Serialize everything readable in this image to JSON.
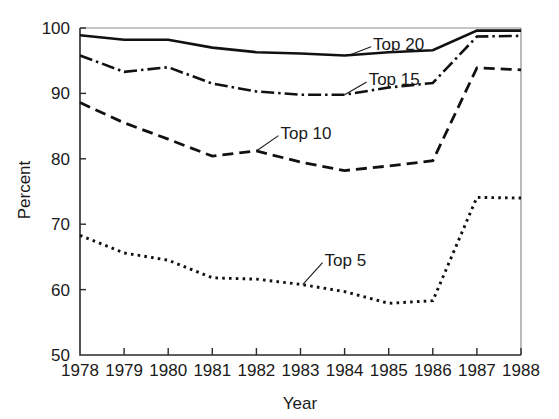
{
  "chart_data": {
    "type": "line",
    "title": "",
    "xlabel": "Year",
    "ylabel": "Percent",
    "x": [
      1978,
      1979,
      1980,
      1981,
      1982,
      1983,
      1984,
      1985,
      1986,
      1987,
      1988
    ],
    "categories": [
      "1978",
      "1979",
      "1980",
      "1981",
      "1982",
      "1983",
      "1984",
      "1985",
      "1986",
      "1987",
      "1988"
    ],
    "xlim": [
      1978,
      1988
    ],
    "ylim": [
      50,
      100
    ],
    "y_ticks": [
      50,
      60,
      70,
      80,
      90,
      100
    ],
    "y_tick_labels": [
      "50",
      "60",
      "70",
      "80",
      "90",
      "100"
    ],
    "x_ticks": [
      1978,
      1979,
      1980,
      1981,
      1982,
      1983,
      1984,
      1985,
      1986,
      1987,
      1988
    ],
    "grid": false,
    "legend_position": "inline-annotations",
    "series": [
      {
        "name": "Top 20",
        "style": "solid",
        "color": "#111111",
        "values": [
          98.9,
          98.2,
          98.2,
          97.0,
          96.3,
          96.1,
          95.8,
          96.3,
          96.6,
          99.6,
          99.6
        ]
      },
      {
        "name": "Top 15",
        "style": "dash-dot",
        "color": "#111111",
        "values": [
          95.8,
          93.3,
          94.0,
          91.5,
          90.3,
          89.8,
          89.8,
          90.9,
          91.6,
          98.7,
          98.8
        ]
      },
      {
        "name": "Top 10",
        "style": "dashed",
        "color": "#111111",
        "values": [
          88.6,
          85.5,
          83.0,
          80.4,
          81.2,
          79.5,
          78.2,
          78.9,
          79.7,
          93.9,
          93.6
        ]
      },
      {
        "name": "Top 5",
        "style": "dotted",
        "color": "#111111",
        "values": [
          68.3,
          65.6,
          64.5,
          61.8,
          61.6,
          60.8,
          59.7,
          57.9,
          58.3,
          74.1,
          74.0
        ]
      }
    ],
    "annotations": [
      {
        "text": "Top 20",
        "series": "Top 20",
        "at_x": 1984.1,
        "label_x": 1984.6,
        "label_y": 97.6
      },
      {
        "text": "Top 15",
        "series": "Top 15",
        "at_x": 1984.0,
        "label_x": 1984.5,
        "label_y": 92.2
      },
      {
        "text": "Top 10",
        "series": "Top 10",
        "at_x": 1982.0,
        "label_x": 1982.5,
        "label_y": 84.0
      },
      {
        "text": "Top 5",
        "series": "Top 5",
        "at_x": 1983.05,
        "label_x": 1983.5,
        "label_y": 64.6
      }
    ]
  }
}
